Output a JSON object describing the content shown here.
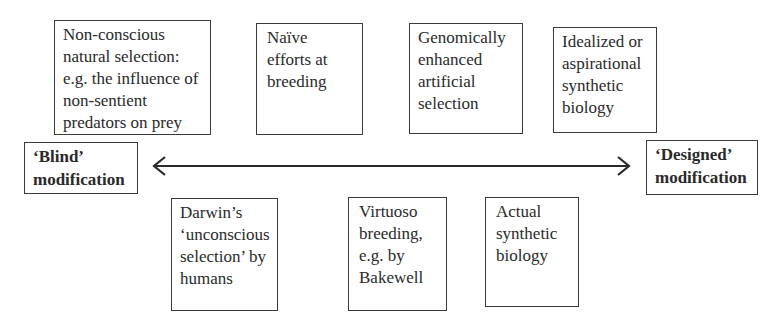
{
  "diagram": {
    "type": "spectrum",
    "axis": {
      "direction": "bidirectional",
      "left_label": [
        "‘Blind’",
        "modification"
      ],
      "right_label": [
        "‘Designed’",
        "modification"
      ]
    },
    "top_boxes": [
      {
        "lines": [
          "Non-conscious",
          "natural selection:",
          "e.g. the influence of",
          "non-sentient",
          "predators on prey"
        ]
      },
      {
        "lines": [
          "Naïve",
          "efforts at",
          "breeding"
        ]
      },
      {
        "lines": [
          "Genomically",
          "enhanced",
          "artificial",
          "selection"
        ]
      },
      {
        "lines": [
          "Idealized or",
          "aspirational",
          "synthetic",
          "biology"
        ]
      }
    ],
    "bottom_boxes": [
      {
        "lines": [
          "Darwin’s",
          "‘unconscious",
          "selection’ by",
          "humans"
        ]
      },
      {
        "lines": [
          "Virtuoso",
          "breeding,",
          "e.g. by",
          "Bakewell"
        ]
      },
      {
        "lines": [
          "Actual",
          "synthetic",
          "biology"
        ]
      }
    ],
    "colors": {
      "stroke": "#3a3a3a",
      "text": "#2a2a2a",
      "background": "#ffffff"
    }
  }
}
